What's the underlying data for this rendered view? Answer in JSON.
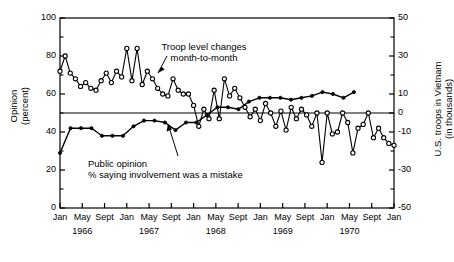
{
  "chart_data": {
    "type": "line",
    "title": "",
    "xlabel": "",
    "grid": false,
    "legend_position": "inline-annotations",
    "axes": {
      "left": {
        "label_line1": "Opinion",
        "label_line2": "(percent)",
        "ticks": [
          0,
          20,
          40,
          60,
          80,
          100
        ],
        "minor_ticks": [
          10,
          30,
          50,
          70,
          90
        ],
        "ylim": [
          0,
          100
        ]
      },
      "right": {
        "label_line1": "U.S. troops in Vietnam",
        "label_line2": "(in thousands)",
        "ticks": [
          -50,
          -30,
          -10,
          0,
          10,
          30,
          50
        ],
        "minor_ticks": [
          -40,
          -20,
          20,
          40
        ],
        "ylim": [
          -50,
          50
        ]
      },
      "x": {
        "tick_labels": [
          "Jan",
          "May",
          "Sept",
          "Jan",
          "May",
          "Sept",
          "Jan",
          "May",
          "Sept",
          "Jan",
          "May",
          "Sept",
          "Jan",
          "May",
          "Sept",
          "Jan"
        ],
        "year_labels": [
          "1966",
          "1967",
          "1968",
          "1969",
          "1970"
        ],
        "range_start": "1966-01",
        "range_end": "1971-01"
      }
    },
    "annotations": [
      {
        "name": "troop-annotation",
        "line1": "Troop level changes",
        "line2": "month-to-month"
      },
      {
        "name": "opinion-annotation",
        "line1": "Public opinion",
        "line2": "% saying involvement was a mistake"
      }
    ],
    "series": [
      {
        "name": "Troop level changes month-to-month",
        "axis": "right",
        "marker": "open-circle",
        "color": "#000000",
        "values": [
          22,
          30,
          21,
          18,
          14,
          16,
          13,
          12,
          17,
          21,
          16,
          22,
          19,
          34,
          17,
          34,
          15,
          22,
          18,
          13,
          10,
          9,
          18,
          12,
          10,
          10,
          4,
          -7,
          2,
          -3,
          12,
          -3,
          18,
          9,
          13,
          8,
          3,
          -2,
          2,
          -4,
          5,
          0,
          -7,
          1,
          -9,
          3,
          -3,
          2,
          -1,
          -7,
          0,
          -26,
          0,
          -11,
          -10,
          0,
          -5,
          -21,
          -8,
          -6,
          0,
          -13,
          -8,
          -13,
          -16,
          -17
        ]
      },
      {
        "name": "Public opinion % saying involvement was a mistake",
        "axis": "left",
        "marker": "filled-dot",
        "color": "#000000",
        "values": [
          29,
          42,
          42,
          42,
          38,
          38,
          38,
          43,
          46,
          46,
          45,
          41,
          45,
          45,
          49,
          53,
          53,
          52,
          56,
          58,
          58,
          58,
          57,
          58,
          59,
          61,
          60,
          58,
          61
        ]
      }
    ]
  }
}
